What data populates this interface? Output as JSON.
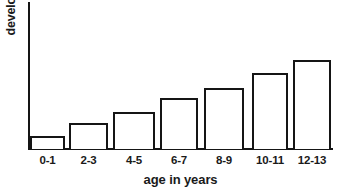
{
  "chart_data": {
    "type": "bar",
    "title": "",
    "subtitle": "",
    "xlabel": "age in years",
    "ylabel": "development",
    "categories": [
      "0-1",
      "2-3",
      "4-5",
      "6-7",
      "8-9",
      "10-11",
      "12-13"
    ],
    "values": [
      13,
      26,
      37,
      51,
      61,
      76,
      89
    ],
    "ylim": [
      0,
      148
    ],
    "xlim": [
      0,
      7
    ],
    "grid": false,
    "legend": null,
    "legend_position": "none",
    "axis_ticks_y": [],
    "axis_ticks_x": [
      "0-1",
      "2-3",
      "4-5",
      "6-7",
      "8-9",
      "10-11",
      "12-13"
    ],
    "annotations": [],
    "bar_style": {
      "fill": "#ffffff",
      "stroke": "#151515",
      "stroke_width": 2
    },
    "axis_color": "#151515",
    "background": "#ffffff",
    "text_color": "#1a1a1a",
    "bars": [
      {
        "category": "0-1",
        "value": 13,
        "x": 30,
        "width": 35,
        "top": 136,
        "height": 13
      },
      {
        "category": "2-3",
        "value": 26,
        "x": 69,
        "width": 39,
        "top": 123,
        "height": 26
      },
      {
        "category": "4-5",
        "value": 37,
        "x": 113,
        "width": 42,
        "top": 112,
        "height": 37
      },
      {
        "category": "6-7",
        "value": 51,
        "x": 160,
        "width": 38,
        "top": 98,
        "height": 51
      },
      {
        "category": "8-9",
        "value": 61,
        "x": 204,
        "width": 40,
        "top": 88,
        "height": 61
      },
      {
        "category": "10-11",
        "value": 76,
        "x": 252,
        "width": 36,
        "top": 73,
        "height": 76
      },
      {
        "category": "12-13",
        "value": 89,
        "x": 293,
        "width": 38,
        "top": 60,
        "height": 89
      }
    ]
  }
}
